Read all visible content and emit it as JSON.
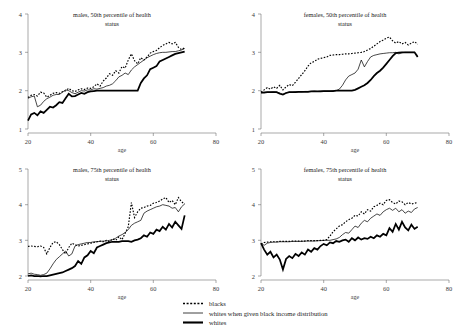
{
  "figure": {
    "background": "#ffffff",
    "ink": "#000000",
    "width": 467,
    "height": 334
  },
  "legend": {
    "position": "bottom-center",
    "entries": [
      {
        "label": "blacks",
        "style": "dotted",
        "key": "blacks"
      },
      {
        "label": "whites when given black income distribution",
        "style": "thin-solid",
        "key": "whites_adjusted"
      },
      {
        "label": "whites",
        "style": "thick-solid",
        "key": "whites"
      }
    ]
  },
  "chart_data": [
    {
      "id": "males-50th",
      "type": "line",
      "title": "males, 50th percentile of health status",
      "title_lines": [
        "males, 50th percentile of health",
        "status"
      ],
      "xlabel": "age",
      "ylabel": "",
      "xlim": [
        20,
        80
      ],
      "ylim": [
        1,
        4
      ],
      "xticks": [
        20,
        40,
        60,
        80
      ],
      "yticks": [
        1,
        2,
        3,
        4
      ],
      "grid": false,
      "x": [
        20,
        21,
        22,
        23,
        24,
        25,
        26,
        27,
        28,
        29,
        30,
        31,
        32,
        33,
        34,
        35,
        36,
        37,
        38,
        39,
        40,
        41,
        42,
        43,
        44,
        45,
        46,
        47,
        48,
        49,
        50,
        51,
        52,
        53,
        54,
        55,
        56,
        57,
        58,
        59,
        60,
        61,
        62,
        63,
        64,
        65,
        66,
        67,
        68,
        69,
        70
      ],
      "series": [
        {
          "name": "blacks",
          "values": [
            1.82,
            1.88,
            1.9,
            1.86,
            1.96,
            1.94,
            1.83,
            1.88,
            1.93,
            1.95,
            1.93,
            1.97,
            2.0,
            2.06,
            2.0,
            1.98,
            2.02,
            2.05,
            2.03,
            2.07,
            2.06,
            2.1,
            2.18,
            2.12,
            2.25,
            2.33,
            2.44,
            2.4,
            2.52,
            2.46,
            2.63,
            2.59,
            2.8,
            2.96,
            2.78,
            2.7,
            2.86,
            2.8,
            2.88,
            2.98,
            3.02,
            3.05,
            3.12,
            3.18,
            3.22,
            3.26,
            3.22,
            3.26,
            3.13,
            3.07,
            3.12
          ]
        },
        {
          "name": "whites_adjusted",
          "values": [
            1.8,
            1.84,
            1.86,
            1.58,
            1.62,
            1.72,
            1.79,
            1.83,
            1.88,
            1.9,
            1.9,
            1.96,
            2.02,
            2.0,
            1.95,
            1.92,
            1.96,
            2.0,
            1.99,
            2.02,
            2.02,
            2.05,
            2.04,
            2.06,
            2.08,
            2.12,
            2.14,
            2.18,
            2.26,
            2.36,
            2.4,
            2.46,
            2.42,
            2.54,
            2.62,
            2.68,
            2.74,
            2.8,
            2.86,
            2.9,
            2.94,
            2.97,
            2.99,
            3.0,
            3.0,
            3.01,
            3.02,
            3.02,
            3.04,
            3.06,
            3.1
          ]
        },
        {
          "name": "whites",
          "values": [
            1.22,
            1.38,
            1.42,
            1.36,
            1.46,
            1.42,
            1.5,
            1.58,
            1.56,
            1.62,
            1.7,
            1.68,
            1.8,
            1.92,
            1.85,
            1.86,
            1.9,
            1.94,
            1.92,
            1.96,
            1.98,
            1.99,
            2.0,
            2.0,
            2.0,
            2.0,
            2.0,
            2.0,
            2.0,
            2.0,
            2.0,
            2.0,
            2.0,
            2.0,
            2.0,
            2.0,
            2.2,
            2.32,
            2.4,
            2.56,
            2.6,
            2.64,
            2.76,
            2.8,
            2.84,
            2.88,
            2.92,
            2.96,
            2.98,
            3.0,
            3.02
          ]
        }
      ]
    },
    {
      "id": "females-50th",
      "type": "line",
      "title": "females, 50th percentile of health status",
      "title_lines": [
        "females, 50th percentile of health",
        "status"
      ],
      "xlabel": "age",
      "ylabel": "",
      "xlim": [
        20,
        80
      ],
      "ylim": [
        1,
        4
      ],
      "xticks": [
        20,
        40,
        60,
        80
      ],
      "yticks": [
        1,
        2,
        3,
        4
      ],
      "grid": false,
      "x": [
        20,
        21,
        22,
        23,
        24,
        25,
        26,
        27,
        28,
        29,
        30,
        31,
        32,
        33,
        34,
        35,
        36,
        37,
        38,
        39,
        40,
        41,
        42,
        43,
        44,
        45,
        46,
        47,
        48,
        49,
        50,
        51,
        52,
        53,
        54,
        55,
        56,
        57,
        58,
        59,
        60,
        61,
        62,
        63,
        64,
        65,
        66,
        67,
        68,
        69,
        70
      ],
      "series": [
        {
          "name": "blacks",
          "values": [
            1.96,
            2.02,
            2.08,
            2.04,
            2.1,
            2.06,
            2.14,
            2.02,
            2.1,
            2.16,
            2.13,
            2.22,
            2.32,
            2.42,
            2.52,
            2.64,
            2.73,
            2.76,
            2.82,
            2.84,
            2.86,
            2.88,
            2.92,
            2.93,
            2.94,
            2.94,
            2.95,
            2.96,
            2.96,
            2.97,
            2.98,
            2.99,
            3.0,
            3.02,
            3.06,
            3.1,
            3.16,
            3.22,
            3.28,
            3.32,
            3.37,
            3.4,
            3.3,
            3.24,
            3.28,
            3.22,
            3.26,
            3.19,
            3.24,
            3.28,
            3.21
          ]
        },
        {
          "name": "whites_adjusted",
          "values": [
            1.95,
            1.96,
            1.96,
            1.96,
            1.97,
            1.96,
            1.94,
            1.9,
            1.94,
            1.96,
            1.96,
            1.97,
            1.97,
            1.97,
            1.98,
            1.98,
            1.98,
            1.99,
            1.98,
            1.99,
            1.99,
            1.99,
            1.99,
            2.0,
            2.0,
            2.04,
            2.14,
            2.28,
            2.38,
            2.42,
            2.46,
            2.56,
            2.8,
            2.62,
            2.76,
            2.88,
            2.92,
            2.94,
            2.96,
            2.97,
            2.98,
            2.99,
            2.99,
            3.0,
            2.96,
            2.99,
            3.0,
            3.0,
            3.0,
            3.0,
            2.92
          ]
        },
        {
          "name": "whites",
          "values": [
            1.95,
            1.95,
            1.96,
            1.96,
            1.96,
            1.96,
            1.92,
            1.9,
            1.94,
            1.96,
            1.96,
            1.96,
            1.97,
            1.97,
            1.97,
            1.97,
            1.98,
            1.98,
            1.98,
            1.98,
            1.99,
            1.99,
            1.99,
            1.99,
            2.0,
            2.0,
            2.0,
            2.0,
            2.0,
            2.0,
            2.02,
            2.06,
            2.1,
            2.14,
            2.2,
            2.28,
            2.38,
            2.46,
            2.52,
            2.6,
            2.7,
            2.8,
            2.9,
            2.98,
            2.99,
            3.0,
            3.0,
            3.0,
            3.0,
            3.0,
            2.88
          ]
        }
      ]
    },
    {
      "id": "males-75th",
      "type": "line",
      "title": "males, 75th percentile of health status",
      "title_lines": [
        "males, 75th percentile of health",
        "status"
      ],
      "xlabel": "age",
      "ylabel": "",
      "xlim": [
        20,
        80
      ],
      "ylim": [
        2,
        5
      ],
      "xticks": [
        20,
        40,
        60,
        80
      ],
      "yticks": [
        2,
        3,
        4,
        5
      ],
      "grid": false,
      "x": [
        20,
        21,
        22,
        23,
        24,
        25,
        26,
        27,
        28,
        29,
        30,
        31,
        32,
        33,
        34,
        35,
        36,
        37,
        38,
        39,
        40,
        41,
        42,
        43,
        44,
        45,
        46,
        47,
        48,
        49,
        50,
        51,
        52,
        53,
        54,
        55,
        56,
        57,
        58,
        59,
        60,
        61,
        62,
        63,
        64,
        65,
        66,
        67,
        68,
        69,
        70
      ],
      "series": [
        {
          "name": "blacks",
          "values": [
            2.83,
            2.84,
            2.83,
            2.82,
            2.84,
            2.8,
            2.62,
            2.8,
            2.94,
            2.96,
            2.88,
            2.74,
            2.62,
            2.8,
            2.92,
            2.88,
            2.84,
            2.86,
            2.88,
            2.9,
            2.92,
            2.94,
            2.96,
            2.98,
            2.96,
            3.0,
            2.96,
            3.04,
            3.0,
            3.1,
            3.02,
            3.2,
            3.38,
            4.06,
            3.64,
            3.8,
            3.9,
            3.92,
            3.96,
            3.98,
            4.04,
            4.06,
            4.1,
            4.16,
            4.2,
            4.06,
            4.12,
            4.0,
            4.2,
            4.08,
            4.02
          ]
        },
        {
          "name": "whites_adjusted",
          "values": [
            2.06,
            2.08,
            2.05,
            2.04,
            2.02,
            2.04,
            2.08,
            2.2,
            2.34,
            2.46,
            2.54,
            2.62,
            2.7,
            2.56,
            2.62,
            2.84,
            2.88,
            2.9,
            2.92,
            2.94,
            2.94,
            2.96,
            2.96,
            2.97,
            2.98,
            2.98,
            3.0,
            3.02,
            3.06,
            3.12,
            3.16,
            3.22,
            3.3,
            3.42,
            3.48,
            3.52,
            3.56,
            3.76,
            3.82,
            3.86,
            3.9,
            3.94,
            3.96,
            4.0,
            3.98,
            3.96,
            3.9,
            3.92,
            3.8,
            3.94,
            4.02
          ]
        },
        {
          "name": "whites",
          "values": [
            2.0,
            2.02,
            2.0,
            2.0,
            1.99,
            2.0,
            2.0,
            2.02,
            2.04,
            2.06,
            2.08,
            2.1,
            2.14,
            2.18,
            2.22,
            2.28,
            2.42,
            2.34,
            2.52,
            2.58,
            2.7,
            2.64,
            2.8,
            2.84,
            2.88,
            2.92,
            2.94,
            2.96,
            2.96,
            2.96,
            2.98,
            2.98,
            2.98,
            2.96,
            3.0,
            3.02,
            3.06,
            3.14,
            3.1,
            3.22,
            3.18,
            3.3,
            3.26,
            3.38,
            3.3,
            3.46,
            3.36,
            3.52,
            3.42,
            3.32,
            3.7
          ]
        }
      ]
    },
    {
      "id": "females-75th",
      "type": "line",
      "title": "females, 75th percentile of health status",
      "title_lines": [
        "females, 75th percentile of health",
        "status"
      ],
      "xlabel": "age",
      "ylabel": "",
      "xlim": [
        20,
        80
      ],
      "ylim": [
        2,
        5
      ],
      "xticks": [
        20,
        40,
        60,
        80
      ],
      "yticks": [
        2,
        3,
        4,
        5
      ],
      "grid": false,
      "x": [
        20,
        21,
        22,
        23,
        24,
        25,
        26,
        27,
        28,
        29,
        30,
        31,
        32,
        33,
        34,
        35,
        36,
        37,
        38,
        39,
        40,
        41,
        42,
        43,
        44,
        45,
        46,
        47,
        48,
        49,
        50,
        51,
        52,
        53,
        54,
        55,
        56,
        57,
        58,
        59,
        60,
        61,
        62,
        63,
        64,
        65,
        66,
        67,
        68,
        69,
        70
      ],
      "series": [
        {
          "name": "blacks",
          "values": [
            2.9,
            2.94,
            2.95,
            2.96,
            2.96,
            2.96,
            2.97,
            2.97,
            2.97,
            2.97,
            2.98,
            2.98,
            2.98,
            2.98,
            2.98,
            2.99,
            2.99,
            2.99,
            2.99,
            3.0,
            3.0,
            3.02,
            3.12,
            3.24,
            3.32,
            3.4,
            3.44,
            3.52,
            3.58,
            3.62,
            3.7,
            3.68,
            3.8,
            3.74,
            3.86,
            3.82,
            3.94,
            3.98,
            4.04,
            4.0,
            4.12,
            4.14,
            4.06,
            4.02,
            4.1,
            4.08,
            4.0,
            4.06,
            4.02,
            4.04,
            4.06
          ]
        },
        {
          "name": "whites_adjusted",
          "values": [
            2.92,
            2.86,
            2.92,
            2.94,
            2.95,
            2.95,
            2.96,
            2.96,
            2.96,
            2.96,
            2.97,
            2.97,
            2.97,
            2.97,
            2.98,
            2.98,
            2.98,
            2.98,
            2.99,
            2.99,
            3.0,
            3.0,
            3.0,
            3.02,
            3.04,
            3.08,
            3.16,
            3.22,
            3.2,
            3.3,
            3.4,
            3.36,
            3.48,
            3.56,
            3.52,
            3.62,
            3.68,
            3.74,
            3.7,
            3.8,
            3.86,
            3.9,
            3.84,
            3.9,
            3.8,
            3.86,
            3.76,
            3.82,
            3.78,
            3.88,
            3.92
          ]
        },
        {
          "name": "whites",
          "values": [
            2.92,
            2.74,
            2.6,
            2.68,
            2.52,
            2.6,
            2.46,
            2.18,
            2.48,
            2.56,
            2.5,
            2.62,
            2.56,
            2.66,
            2.6,
            2.74,
            2.68,
            2.78,
            2.74,
            2.84,
            2.9,
            2.86,
            2.94,
            2.92,
            2.98,
            2.96,
            3.0,
            3.02,
            2.96,
            3.06,
            3.0,
            3.08,
            3.02,
            3.06,
            3.04,
            3.1,
            3.06,
            3.14,
            3.1,
            3.18,
            3.14,
            3.34,
            3.24,
            3.46,
            3.3,
            3.52,
            3.36,
            3.28,
            3.44,
            3.32,
            3.38
          ]
        }
      ]
    }
  ]
}
